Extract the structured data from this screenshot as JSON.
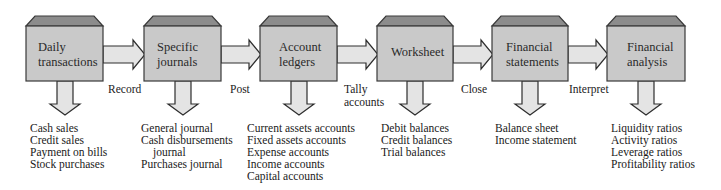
{
  "colors": {
    "box_face": "#c9c9c9",
    "box_top": "#8c8c8c",
    "box_stroke": "#3a3a3a",
    "arrow_fill": "#e4e4e4",
    "arrow_stroke": "#2e2e2e"
  },
  "stages": [
    {
      "title_line1": "Daily",
      "title_line2": "transactions",
      "items": [
        "Cash sales",
        "Credit sales",
        "Payment on bills",
        "Stock purchases"
      ]
    },
    {
      "title_line1": "Specific",
      "title_line2": "journals",
      "items": [
        "General journal",
        "Cash disbursements",
        "journal",
        "Purchases journal"
      ]
    },
    {
      "title_line1": "Account",
      "title_line2": "ledgers",
      "items": [
        "Current assets accounts",
        "Fixed assets accounts",
        "Expense accounts",
        "Income accounts",
        "Capital accounts"
      ]
    },
    {
      "title_line1": "Worksheet",
      "title_line2": "",
      "items": [
        "Debit balances",
        "Credit balances",
        "Trial balances"
      ]
    },
    {
      "title_line1": "Financial",
      "title_line2": "statements",
      "items": [
        "Balance sheet",
        "Income statement"
      ]
    },
    {
      "title_line1": "Financial",
      "title_line2": "analysis",
      "items": [
        "Liquidity ratios",
        "Activity ratios",
        "Leverage ratios",
        "Profitability ratios"
      ]
    }
  ],
  "connectors": [
    {
      "line1": "Record",
      "line2": ""
    },
    {
      "line1": "Post",
      "line2": ""
    },
    {
      "line1": "Tally",
      "line2": "accounts"
    },
    {
      "line1": "Close",
      "line2": ""
    },
    {
      "line1": "Interpret",
      "line2": ""
    }
  ]
}
